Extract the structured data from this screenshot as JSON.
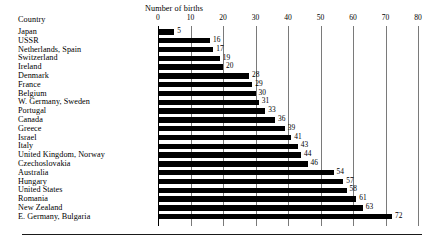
{
  "figure": {
    "category_axis_title": "Country",
    "value_axis_title": "Number of births"
  },
  "chart_data": {
    "type": "bar",
    "orientation": "horizontal",
    "title": "",
    "subtitle": "",
    "xlabel": "Number of births",
    "ylabel": "Country",
    "xlim": [
      0,
      80
    ],
    "ylim": null,
    "grid": true,
    "gridlines": "vertical",
    "legend": null,
    "legend_position": "none",
    "xticks": [
      0,
      10,
      20,
      30,
      40,
      50,
      60,
      70,
      80
    ],
    "xtick_labels": [
      "0",
      "10",
      "20",
      "30",
      "40",
      "50",
      "60",
      "70",
      "80"
    ],
    "data_labels": true,
    "categories": [
      "Japan",
      "USSR",
      "Netherlands, Spain",
      "Switzerland",
      "Ireland",
      "Denmark",
      "France",
      "Belgium",
      "W. Germany, Sweden",
      "Portugal",
      "Canada",
      "Greece",
      "Israel",
      "Italy",
      "United Kingdom, Norway",
      "Czechoslovakia",
      "Australia",
      "Hungary",
      " United States",
      "Romania",
      "New Zealand",
      "E. Germany, Bulgaria"
    ],
    "values": [
      5,
      16,
      17,
      19,
      20,
      28,
      29,
      30,
      31,
      33,
      36,
      39,
      41,
      43,
      44,
      46,
      54,
      57,
      58,
      61,
      63,
      72
    ],
    "value_labels": [
      "5",
      "16",
      "17",
      "19",
      "20",
      "28",
      "29",
      "30",
      "31",
      "33",
      "36",
      "39",
      "41",
      "43",
      "44",
      "46",
      "54",
      "57",
      "58",
      "61",
      "63",
      "72"
    ],
    "colors": {
      "bar": "#000000",
      "gridline": "#7a7a7a",
      "axis": "#000000",
      "text": "#000000",
      "background": "#ffffff"
    }
  }
}
